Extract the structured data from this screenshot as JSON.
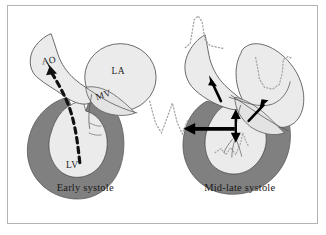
{
  "figure": {
    "border_color": "#b3b3b3",
    "background": "#ffffff"
  },
  "colors": {
    "myocardium": "#808080",
    "chamber_fill": "#ebebeb",
    "chamber_fill_light": "#f2f2f2",
    "outline": "#595959",
    "arrow": "#000000",
    "dotted": "#a6a6a6",
    "text": "#262626"
  },
  "panels": [
    {
      "id": "early-systole",
      "caption": "Early systole",
      "labels": [
        {
          "key": "ao",
          "text": "AO",
          "role": "aorta"
        },
        {
          "key": "la",
          "text": "LA",
          "role": "left-atrium"
        },
        {
          "key": "mv",
          "text": "MV",
          "role": "mitral-valve"
        },
        {
          "key": "lv",
          "text": "LV",
          "role": "left-ventricle"
        }
      ],
      "annotations": [
        {
          "key": "ejection-flow",
          "style": "thick-dashed-arrow",
          "description": "Dashed arrow of blood flow from left ventricle apex through outflow tract into aorta"
        }
      ]
    },
    {
      "id": "mid-late-systole",
      "caption": "Mid-late systole",
      "labels": [],
      "annotations": [
        {
          "key": "aortic-outflow-arrow",
          "style": "solid-arrow",
          "description": "Small solid arrow directed up into aorta"
        },
        {
          "key": "leaflet-motion-arrow",
          "style": "solid-double-arrow",
          "description": "Vertical double-headed arrow at mitral leaflet coaptation point"
        },
        {
          "key": "la-regurgitation-arrow",
          "style": "solid-arrow",
          "description": "Solid arrow directed into left atrium indicating mitral regurgitation jet"
        },
        {
          "key": "lv-pressure-arrow",
          "style": "thick-solid-arrow",
          "description": "Thick horizontal arrow pointing left out of the left ventricular wall"
        },
        {
          "key": "doppler-spike-trace",
          "style": "dotted-waveform",
          "description": "Dotted late-peaking spike velocity tracing above the aorta"
        },
        {
          "key": "mitral-regurg-trace",
          "style": "dotted-waveform",
          "description": "Dotted U-shaped regurgitant flow tracing inside left atrium"
        },
        {
          "key": "lv-pressure-trace",
          "style": "dotted-waveform",
          "description": "Dotted V-shaped pressure tracing to the left of the ventricle"
        },
        {
          "key": "apex-trace",
          "style": "dotted-waveform",
          "description": "Dotted low-amplitude squiggle tracing within the ventricular apex"
        }
      ]
    }
  ]
}
